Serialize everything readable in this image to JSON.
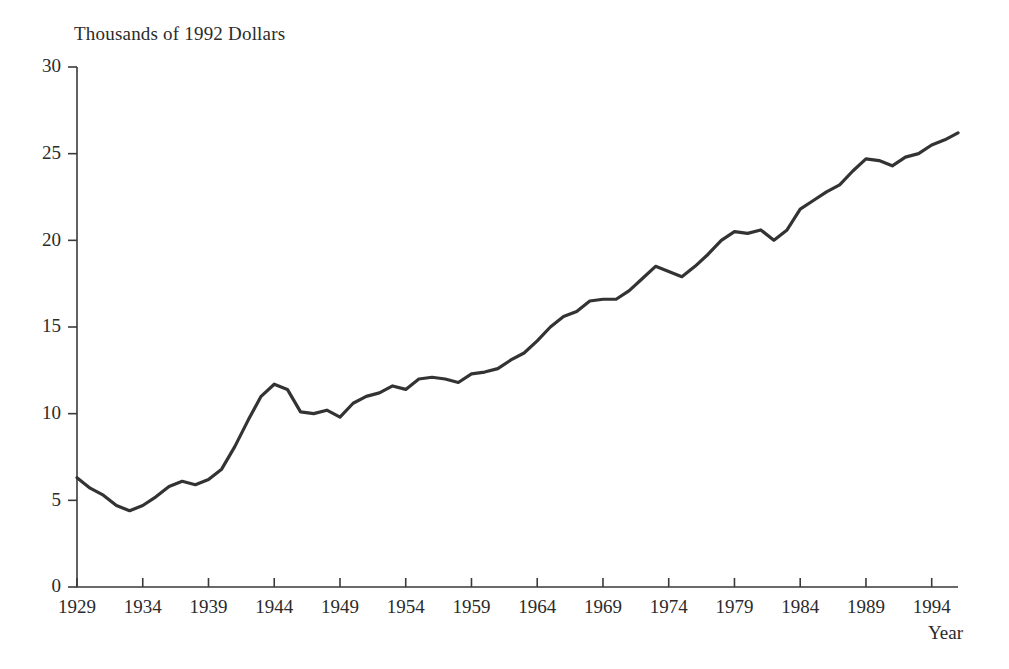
{
  "chart_data": {
    "type": "line",
    "title": "Thousands of 1992 Dollars",
    "xlabel": "Year",
    "ylabel": "",
    "xlim": [
      1929,
      1996
    ],
    "ylim": [
      0,
      30
    ],
    "grid": false,
    "legend": null,
    "line_color": "#333333",
    "x_ticks": [
      1929,
      1934,
      1939,
      1944,
      1949,
      1954,
      1959,
      1964,
      1969,
      1974,
      1979,
      1984,
      1989,
      1994
    ],
    "x_tick_labels": [
      "1929",
      "1934",
      "1939",
      "1944",
      "1949",
      "1954",
      "1959",
      "1964",
      "1969",
      "1974",
      "1979",
      "1984",
      "1989",
      "1994"
    ],
    "y_ticks": [
      0,
      5,
      10,
      15,
      20,
      25,
      30
    ],
    "y_tick_labels": [
      "0",
      "5",
      "10",
      "15",
      "20",
      "25",
      "30"
    ],
    "series": [
      {
        "name": "Real income per capita",
        "x": [
          1929,
          1930,
          1931,
          1932,
          1933,
          1934,
          1935,
          1936,
          1937,
          1938,
          1939,
          1940,
          1941,
          1942,
          1943,
          1944,
          1945,
          1946,
          1947,
          1948,
          1949,
          1950,
          1951,
          1952,
          1953,
          1954,
          1955,
          1956,
          1957,
          1958,
          1959,
          1960,
          1961,
          1962,
          1963,
          1964,
          1965,
          1966,
          1967,
          1968,
          1969,
          1970,
          1971,
          1972,
          1973,
          1974,
          1975,
          1976,
          1977,
          1978,
          1979,
          1980,
          1981,
          1982,
          1983,
          1984,
          1985,
          1986,
          1987,
          1988,
          1989,
          1990,
          1991,
          1992,
          1993,
          1994,
          1995,
          1996
        ],
        "values": [
          6.3,
          5.7,
          5.3,
          4.7,
          4.4,
          4.7,
          5.2,
          5.8,
          6.1,
          5.9,
          6.2,
          6.8,
          8.1,
          9.6,
          11.0,
          11.7,
          11.4,
          10.1,
          10.0,
          10.2,
          9.8,
          10.6,
          11.0,
          11.2,
          11.6,
          11.4,
          12.0,
          12.1,
          12.0,
          11.8,
          12.3,
          12.4,
          12.6,
          13.1,
          13.5,
          14.2,
          15.0,
          15.6,
          15.9,
          16.5,
          16.6,
          16.6,
          17.1,
          17.8,
          18.5,
          18.2,
          17.9,
          18.5,
          19.2,
          20.0,
          20.5,
          20.4,
          20.6,
          20.0,
          20.6,
          21.8,
          22.3,
          22.8,
          23.2,
          24.0,
          24.7,
          24.6,
          24.3,
          24.8,
          25.0,
          25.5,
          25.8,
          26.2
        ]
      }
    ]
  },
  "figure": {
    "title": "Thousands of 1992 Dollars",
    "xlabel": "Year"
  }
}
